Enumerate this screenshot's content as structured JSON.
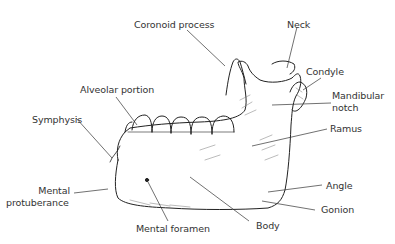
{
  "diagram": {
    "labels": {
      "coronoid_process": "Coronoid process",
      "neck": "Neck",
      "condyle": "Condyle",
      "mandibular_notch_line1": "Mandibular",
      "mandibular_notch_line2": "notch",
      "alveolar_portion": "Alveolar portion",
      "symphysis": "Symphysis",
      "ramus": "Ramus",
      "mental_protuberance_line1": "Mental",
      "mental_protuberance_line2": "protuberance",
      "angle": "Angle",
      "gonion": "Gonion",
      "body": "Body",
      "mental_foramen": "Mental foramen"
    },
    "colors": {
      "ink": "#222222",
      "label_text": "#333333",
      "background": "#ffffff"
    }
  }
}
